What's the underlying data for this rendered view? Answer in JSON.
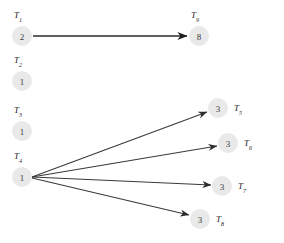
{
  "diagram": {
    "type": "directed-graph",
    "background_color": "#ffffff",
    "node_fill_color": "#e9e9e9",
    "edge_color": "#3a3a3a",
    "label_color": "#1c1c1c",
    "nodes": [
      {
        "id": "T1",
        "label_base": "T",
        "label_sub": "1",
        "value": "2",
        "cx": 22,
        "cy": 36,
        "r": 10,
        "label_x": 14,
        "label_y": 15
      },
      {
        "id": "T2",
        "label_base": "T",
        "label_sub": "2",
        "value": "1",
        "cx": 22,
        "cy": 81,
        "r": 10,
        "label_x": 14,
        "label_y": 60
      },
      {
        "id": "T3",
        "label_base": "T",
        "label_sub": "3",
        "value": "1",
        "cx": 22,
        "cy": 131,
        "r": 10,
        "label_x": 14,
        "label_y": 110
      },
      {
        "id": "T4",
        "label_base": "T",
        "label_sub": "4",
        "value": "1",
        "cx": 22,
        "cy": 177,
        "r": 10,
        "label_x": 14,
        "label_y": 156
      },
      {
        "id": "T5",
        "label_base": "T",
        "label_sub": "5",
        "value": "3",
        "cx": 218,
        "cy": 108,
        "r": 10,
        "label_x": 234,
        "label_y": 108
      },
      {
        "id": "T6",
        "label_base": "T",
        "label_sub": "6",
        "value": "3",
        "cx": 228,
        "cy": 143,
        "r": 10,
        "label_x": 244,
        "label_y": 143
      },
      {
        "id": "T7",
        "label_base": "T",
        "label_sub": "7",
        "value": "3",
        "cx": 222,
        "cy": 186,
        "r": 10,
        "label_x": 238,
        "label_y": 186
      },
      {
        "id": "T8",
        "label_base": "T",
        "label_sub": "8",
        "value": "3",
        "cx": 200,
        "cy": 219,
        "r": 10,
        "label_x": 216,
        "label_y": 219
      },
      {
        "id": "T9",
        "label_base": "T",
        "label_sub": "9",
        "value": "8",
        "cx": 199,
        "cy": 36,
        "r": 10,
        "label_x": 191,
        "label_y": 15
      }
    ],
    "edges": [
      {
        "from": "T1",
        "to": "T9",
        "x1": 33,
        "y1": 36,
        "x2": 187,
        "y2": 36,
        "weight": "thick"
      },
      {
        "from": "T4",
        "to": "T5",
        "x1": 32,
        "y1": 177,
        "x2": 207,
        "y2": 112,
        "weight": "normal"
      },
      {
        "from": "T4",
        "to": "T6",
        "x1": 32,
        "y1": 177,
        "x2": 217,
        "y2": 146,
        "weight": "normal"
      },
      {
        "from": "T4",
        "to": "T7",
        "x1": 32,
        "y1": 177,
        "x2": 211,
        "y2": 185,
        "weight": "normal"
      },
      {
        "from": "T4",
        "to": "T8",
        "x1": 32,
        "y1": 178,
        "x2": 189,
        "y2": 215,
        "weight": "normal"
      }
    ]
  }
}
